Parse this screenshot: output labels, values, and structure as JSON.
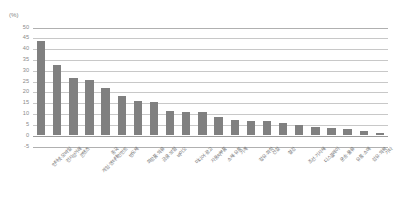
{
  "chart": {
    "unit_label": "(%)",
    "bar_color": "#808080",
    "gridline_color": "#c8c8c8",
    "axis_color": "#9b9b9b",
    "label_color": "#8a8a8a"
  },
  "chart_data": {
    "type": "bar",
    "title": "",
    "subtitle": "",
    "xlabel": "",
    "ylabel": "(%)",
    "ylim": [
      -5,
      50
    ],
    "yticks": [
      50,
      45,
      40,
      35,
      30,
      25,
      20,
      15,
      10,
      5,
      0,
      -5
    ],
    "grid": true,
    "legend": false,
    "categories": [
      "인터넷·모바일",
      "전자상거래",
      "콘텐츠",
      "게임·엔터테인먼트",
      "중국",
      "반도체",
      "화장품·의류",
      "금융·보험",
      "바이오",
      "미디어·광고",
      "자동차부품",
      "소재·유통",
      "기계",
      "정유·화학",
      "건설",
      "철강",
      "조선·기자재",
      "디스플레이",
      "운송·물류",
      "유통·소매",
      "섬유·의복",
      "기타"
    ],
    "values": [
      43.5,
      32.5,
      26.5,
      25.5,
      22.0,
      18.0,
      16.0,
      15.5,
      11.0,
      10.5,
      10.5,
      8.5,
      7.0,
      6.5,
      6.5,
      5.5,
      4.5,
      4.0,
      3.5,
      3.0,
      2.0,
      1.0
    ]
  }
}
